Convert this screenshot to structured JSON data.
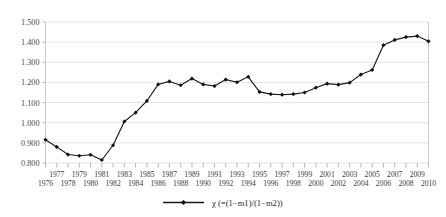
{
  "chart_data": {
    "type": "line",
    "title": "",
    "xlabel": "",
    "ylabel": "",
    "ylim": [
      0.8,
      1.5
    ],
    "ytick_labels": [
      "1.500",
      "1.400",
      "1.300",
      "1.200",
      "1.100",
      "1.000",
      "0.900",
      "0.800"
    ],
    "ytick_values": [
      1.5,
      1.4,
      1.3,
      1.2,
      1.1,
      1.0,
      0.9,
      0.8
    ],
    "grid": true,
    "legend_position": "bottom-center",
    "legend": [
      "χ (=(1−m1)/(1−m2))"
    ],
    "categories": [
      "1976",
      "1977",
      "1978",
      "1979",
      "1980",
      "1981",
      "1982",
      "1983",
      "1984",
      "1985",
      "1986",
      "1987",
      "1988",
      "1989",
      "1990",
      "1991",
      "1992",
      "1993",
      "1994",
      "1995",
      "1996",
      "1997",
      "1998",
      "1999",
      "2000",
      "2001",
      "2002",
      "2003",
      "2004",
      "2005",
      "2006",
      "2007",
      "2008",
      "2009",
      "2010"
    ],
    "series": [
      {
        "name": "χ (=(1−m1)/(1−m2))",
        "color": "#111111",
        "marker": "diamond",
        "values": [
          0.915,
          0.88,
          0.842,
          0.836,
          0.841,
          0.815,
          0.888,
          1.006,
          1.05,
          1.108,
          1.19,
          1.205,
          1.186,
          1.219,
          1.19,
          1.182,
          1.214,
          1.201,
          1.228,
          1.153,
          1.142,
          1.139,
          1.142,
          1.15,
          1.174,
          1.194,
          1.189,
          1.199,
          1.239,
          1.262,
          1.385,
          1.411,
          1.425,
          1.43,
          1.404
        ]
      }
    ]
  },
  "axis": {
    "x_row_top": [
      "1977",
      "1979",
      "1981",
      "1983",
      "1985",
      "1987",
      "1989",
      "1991",
      "1993",
      "1995",
      "1997",
      "1999",
      "2001",
      "2003",
      "2005",
      "2007",
      "2009"
    ],
    "x_row_bottom": [
      "1976",
      "1978",
      "1980",
      "1982",
      "1984",
      "1986",
      "1988",
      "1990",
      "1992",
      "1994",
      "1996",
      "1998",
      "2000",
      "2002",
      "2004",
      "2006",
      "2008",
      "2010"
    ]
  },
  "colors": {
    "series": "#111111",
    "grid": "#d9d9d9",
    "axis": "#bdbdbd",
    "text": "#3a3a3a",
    "background": "#ffffff"
  }
}
